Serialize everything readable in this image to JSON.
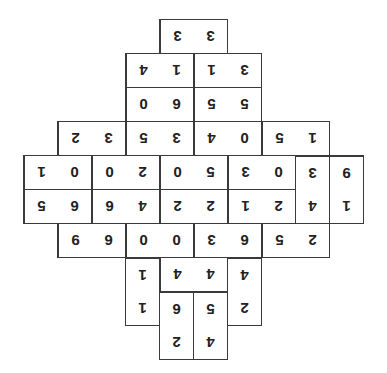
{
  "puzzle": {
    "type": "domino-grid",
    "orientation": "upside-down",
    "unit_px": 34,
    "origin": {
      "x": 23,
      "y": 19
    },
    "dominoes": [
      {
        "id": 0,
        "col": 4,
        "row": 0,
        "dir": "h",
        "a": "3",
        "b": "3"
      },
      {
        "id": 1,
        "col": 3,
        "row": 1,
        "dir": "h",
        "a": "4",
        "b": "1"
      },
      {
        "id": 2,
        "col": 5,
        "row": 1,
        "dir": "h",
        "a": "1",
        "b": "3"
      },
      {
        "id": 3,
        "col": 3,
        "row": 2,
        "dir": "h",
        "a": "0",
        "b": "6"
      },
      {
        "id": 4,
        "col": 5,
        "row": 2,
        "dir": "h",
        "a": "5",
        "b": "5"
      },
      {
        "id": 5,
        "col": 1,
        "row": 3,
        "dir": "h",
        "a": "2",
        "b": "3"
      },
      {
        "id": 6,
        "col": 3,
        "row": 3,
        "dir": "h",
        "a": "5",
        "b": "3"
      },
      {
        "id": 7,
        "col": 5,
        "row": 3,
        "dir": "h",
        "a": "4",
        "b": "0"
      },
      {
        "id": 8,
        "col": 7,
        "row": 3,
        "dir": "h",
        "a": "5",
        "b": "1"
      },
      {
        "id": 9,
        "col": 0,
        "row": 4,
        "dir": "h",
        "a": "1",
        "b": "0"
      },
      {
        "id": 10,
        "col": 2,
        "row": 4,
        "dir": "h",
        "a": "0",
        "b": "2"
      },
      {
        "id": 11,
        "col": 4,
        "row": 4,
        "dir": "h",
        "a": "0",
        "b": "5"
      },
      {
        "id": 12,
        "col": 6,
        "row": 4,
        "dir": "h",
        "a": "3",
        "b": "0"
      },
      {
        "id": 13,
        "col": 8,
        "row": 4,
        "dir": "v",
        "a": "3",
        "b": "4"
      },
      {
        "id": 14,
        "col": 9,
        "row": 4,
        "dir": "v",
        "a": "9",
        "b": "1"
      },
      {
        "id": 15,
        "col": 0,
        "row": 5,
        "dir": "h",
        "a": "5",
        "b": "6"
      },
      {
        "id": 16,
        "col": 2,
        "row": 5,
        "dir": "h",
        "a": "6",
        "b": "4"
      },
      {
        "id": 17,
        "col": 4,
        "row": 5,
        "dir": "h",
        "a": "2",
        "b": "2"
      },
      {
        "id": 18,
        "col": 6,
        "row": 5,
        "dir": "h",
        "a": "1",
        "b": "2"
      },
      {
        "id": 19,
        "col": 1,
        "row": 6,
        "dir": "h",
        "a": "9",
        "b": "6"
      },
      {
        "id": 20,
        "col": 3,
        "row": 6,
        "dir": "h",
        "a": "0",
        "b": "0"
      },
      {
        "id": 21,
        "col": 5,
        "row": 6,
        "dir": "h",
        "a": "3",
        "b": "6"
      },
      {
        "id": 22,
        "col": 7,
        "row": 6,
        "dir": "h",
        "a": "5",
        "b": "2"
      },
      {
        "id": 23,
        "col": 3,
        "row": 7,
        "dir": "v",
        "a": "1",
        "b": "1"
      },
      {
        "id": 24,
        "col": 4,
        "row": 7,
        "dir": "h",
        "a": "4",
        "b": "4"
      },
      {
        "id": 25,
        "col": 6,
        "row": 7,
        "dir": "v",
        "a": "4",
        "b": "2"
      },
      {
        "id": 26,
        "col": 4,
        "row": 8,
        "dir": "v",
        "a": "6",
        "b": "2"
      },
      {
        "id": 27,
        "col": 5,
        "row": 8,
        "dir": "v",
        "a": "5",
        "b": "4"
      }
    ]
  }
}
